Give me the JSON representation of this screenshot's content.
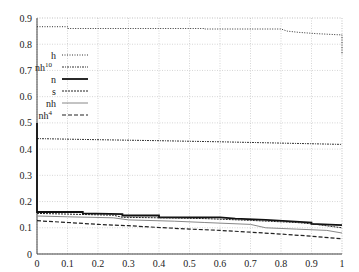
{
  "chart_data": {
    "type": "line",
    "title": "",
    "xlabel": "",
    "ylabel": "",
    "xlim": [
      0,
      1
    ],
    "ylim": [
      0,
      0.9
    ],
    "grid": true,
    "legend_position": "upper-left",
    "x_ticks": [
      "0",
      "0.1",
      "0.2",
      "0.3",
      "0.4",
      "0.5",
      "0.6",
      "0.7",
      "0.8",
      "0.9",
      "1"
    ],
    "y_ticks": [
      "0",
      "0.1",
      "0.2",
      "0.3",
      "0.4",
      "0.5",
      "0.6",
      "0.7",
      "0.8",
      "0.9"
    ],
    "series": [
      {
        "name": "h",
        "sup": "",
        "style": "dotted",
        "x": [
          0,
          0.1,
          0.1,
          0.55,
          0.55,
          0.8,
          0.82,
          0.86,
          0.92,
          0.99,
          1.0,
          1.0
        ],
        "y": [
          0.867,
          0.867,
          0.86,
          0.86,
          0.858,
          0.858,
          0.85,
          0.845,
          0.84,
          0.836,
          0.836,
          0.76
        ]
      },
      {
        "name": "nh",
        "sup": "10",
        "style": "dash-dot",
        "x": [
          0,
          0.2,
          0.4,
          0.6,
          0.8,
          1.0
        ],
        "y": [
          0.44,
          0.436,
          0.432,
          0.428,
          0.423,
          0.418
        ]
      },
      {
        "name": "n",
        "sup": "",
        "style": "thick-solid",
        "x": [
          0,
          0,
          0.15,
          0.15,
          0.28,
          0.28,
          0.4,
          0.4,
          0.6,
          0.65,
          0.75,
          0.82,
          0.9,
          0.9,
          1.0
        ],
        "y": [
          0.5,
          0.16,
          0.16,
          0.155,
          0.152,
          0.147,
          0.147,
          0.14,
          0.14,
          0.135,
          0.13,
          0.125,
          0.12,
          0.115,
          0.11
        ]
      },
      {
        "name": "s",
        "sup": "",
        "style": "dashed-fine",
        "x": [
          0,
          0.1,
          0.25,
          0.28,
          0.4,
          0.55,
          0.7,
          0.85,
          0.9,
          1.0
        ],
        "y": [
          0.155,
          0.152,
          0.148,
          0.14,
          0.138,
          0.135,
          0.128,
          0.12,
          0.115,
          0.1
        ]
      },
      {
        "name": "nh",
        "sup": "",
        "style": "thin-solid-gray",
        "x": [
          0,
          0.1,
          0.25,
          0.3,
          0.45,
          0.55,
          0.7,
          0.75,
          0.85,
          0.95,
          1.0
        ],
        "y": [
          0.145,
          0.142,
          0.138,
          0.13,
          0.125,
          0.12,
          0.113,
          0.1,
          0.095,
          0.09,
          0.08
        ]
      },
      {
        "name": "nh",
        "sup": "4",
        "style": "dashed",
        "x": [
          0,
          0.1,
          0.2,
          0.3,
          0.4,
          0.5,
          0.6,
          0.7,
          0.8,
          0.9,
          1.0
        ],
        "y": [
          0.127,
          0.12,
          0.113,
          0.108,
          0.101,
          0.095,
          0.09,
          0.083,
          0.076,
          0.068,
          0.058
        ]
      }
    ]
  }
}
